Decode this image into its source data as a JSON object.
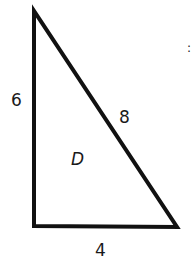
{
  "figure": {
    "shape": "right-triangle",
    "region_label": "D",
    "sides": {
      "left_vertical": "6",
      "hypotenuse": "8",
      "bottom": "4"
    },
    "stroke_color": "#111111",
    "fill_color": "#ffffff",
    "edge_mark": ":"
  }
}
